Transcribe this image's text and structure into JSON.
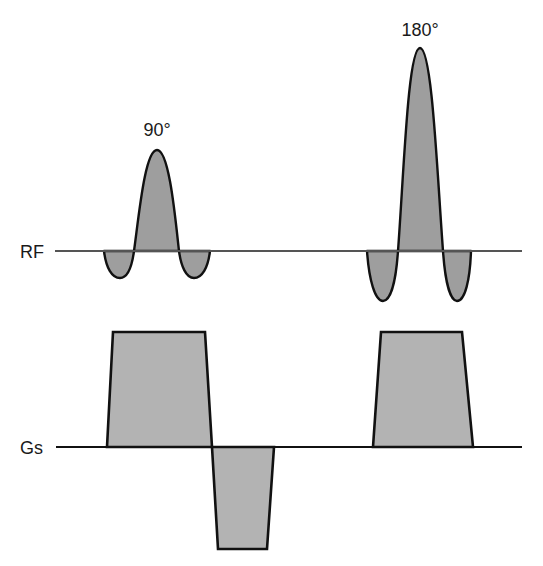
{
  "diagram": {
    "colors": {
      "background": "#ffffff",
      "rf_fill": "#9e9e9e",
      "gradient_fill": "#b3b3b3",
      "outline": "#111111",
      "rf_baseline": "#555555"
    },
    "rows": [
      {
        "label": "RF",
        "baseline_y": 251,
        "baseline_x": [
          55,
          522
        ],
        "pulses": [
          {
            "label": "90°",
            "shape": "sinc",
            "center_x": 157,
            "peak_y": 150,
            "main_lobe_x": [
              134,
              179
            ],
            "side_lobes": [
              [
                104,
                134
              ],
              [
                179,
                210
              ]
            ],
            "side_lobe_min_y": 278
          },
          {
            "label": "180°",
            "shape": "sinc",
            "center_x": 420,
            "peak_y": 48,
            "main_lobe_x": [
              398,
              443
            ],
            "side_lobes": [
              [
                367,
                398
              ],
              [
                443,
                471
              ]
            ],
            "side_lobe_min_y": 301
          }
        ]
      },
      {
        "label": "Gs",
        "baseline_y": 447,
        "baseline_x": [
          56,
          522
        ],
        "lobes": [
          {
            "name": "slice-select-90",
            "polarity": "positive",
            "bottom_x": [
              107,
              212
            ],
            "top_x": [
              113,
              205
            ],
            "top_y": 332
          },
          {
            "name": "rephasing",
            "polarity": "negative",
            "bottom_x": [
              212,
              274
            ],
            "top_x": [
              218,
              267
            ],
            "peak_y": 549
          },
          {
            "name": "slice-select-180",
            "polarity": "positive",
            "bottom_x": [
              373,
              473
            ],
            "top_x": [
              381,
              462
            ],
            "top_y": 332
          }
        ]
      }
    ]
  }
}
